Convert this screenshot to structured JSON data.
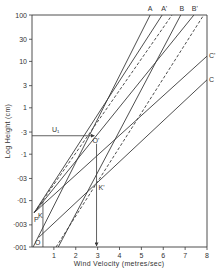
{
  "chart_data": {
    "type": "line",
    "title": "",
    "xlabel": "Wind Velocity (metres/sec)",
    "ylabel": "Log Height (cm)",
    "xlim": [
      0,
      8
    ],
    "ylim": [
      0.001,
      100
    ],
    "yscale": "log",
    "grid": false,
    "legend": "none (lines labelled at ends)",
    "x_ticks": [
      "1",
      "2",
      "3",
      "4",
      "5",
      "6",
      "7",
      "8"
    ],
    "y_ticks": [
      "100",
      "30",
      "10",
      "3",
      "1",
      "·3",
      "·1",
      "·03",
      "·01",
      "·003",
      "·001"
    ],
    "y_tick_values": [
      100,
      30,
      10,
      3,
      1,
      0.3,
      0.1,
      0.03,
      0.01,
      0.003,
      0.001
    ],
    "series": [
      {
        "name": "A",
        "style": "solid",
        "points": [
          [
            0.05,
            0.001
          ],
          [
            5.4,
            100
          ]
        ]
      },
      {
        "name": "A'",
        "style": "solid",
        "points": [
          [
            0.1,
            0.0055
          ],
          [
            5.95,
            100
          ]
        ]
      },
      {
        "name": "A'-dashed",
        "style": "dashed",
        "points": [
          [
            0.1,
            0.0055
          ],
          [
            6.4,
            100
          ]
        ]
      },
      {
        "name": "B",
        "style": "solid",
        "points": [
          [
            1.2,
            0.001
          ],
          [
            6.8,
            100
          ]
        ]
      },
      {
        "name": "B'",
        "style": "solid",
        "points": [
          [
            0.1,
            0.0055
          ],
          [
            7.4,
            100
          ]
        ]
      },
      {
        "name": "B-dashed",
        "style": "dashed",
        "points": [
          [
            1.1,
            0.001
          ],
          [
            7.85,
            100
          ]
        ]
      },
      {
        "name": "C'",
        "style": "solid",
        "points": [
          [
            0.1,
            0.0055
          ],
          [
            8,
            13
          ]
        ]
      },
      {
        "name": "C",
        "style": "solid",
        "points": [
          [
            0.3,
            0.0016
          ],
          [
            8,
            4
          ]
        ]
      }
    ],
    "annotations": [
      {
        "text": "U₁",
        "type": "horizontal-arrow",
        "at_y": 0.25,
        "from_x": 0,
        "to_x": 2.9
      },
      {
        "text": "O'",
        "type": "point",
        "x": 2.9,
        "y": 0.27
      },
      {
        "text": "K'",
        "type": "vertical-arrow",
        "x": 2.95,
        "from_y": 0.25,
        "to_y": 0.001
      },
      {
        "text": "P",
        "type": "point",
        "x": 0.1,
        "y": 0.0055
      },
      {
        "text": "K",
        "type": "vertical-line",
        "x": 0.5,
        "from_y": 0.01,
        "to_y": 0.001
      },
      {
        "text": "O",
        "type": "point",
        "x": 0.1,
        "y": 0.001
      }
    ]
  },
  "labels": {
    "xlabel": "Wind Velocity (metres/sec)",
    "ylabel": "Log Height (cm)",
    "series_end_labels": {
      "A": "A",
      "A_prime": "A'",
      "B": "B",
      "B_prime": "B'",
      "C_prime": "C'",
      "C": "C"
    },
    "U1": "U₁",
    "O_prime": "O'",
    "K_prime": "K'",
    "P": "P",
    "K": "K",
    "O": "O"
  },
  "colors": {
    "ink": "#3a3a3a",
    "background": "#ffffff"
  }
}
